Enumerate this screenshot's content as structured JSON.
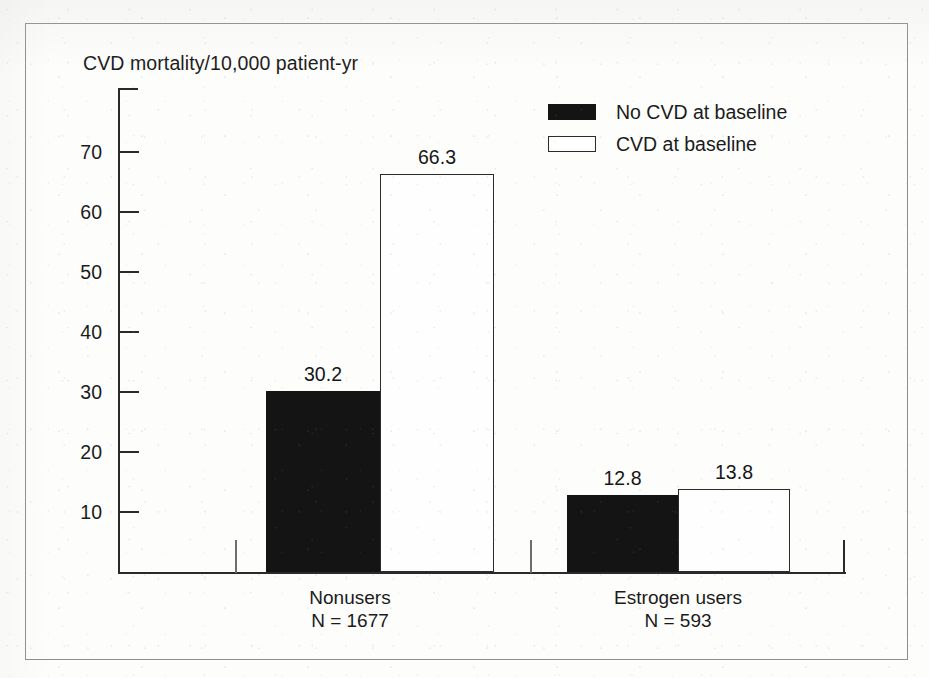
{
  "chart_data": {
    "type": "bar",
    "title": "",
    "ylabel": "CVD mortality/10,000 patient-yr",
    "xlabel": "",
    "ylim": [
      0,
      80
    ],
    "grid": false,
    "legend_position": "top-right",
    "categories": [
      "Nonusers",
      "Estrogen users"
    ],
    "category_sublabels": [
      "N = 1677",
      "N = 593"
    ],
    "yticks": [
      10,
      20,
      30,
      40,
      50,
      60,
      70
    ],
    "series": [
      {
        "name": "No CVD at baseline",
        "color": "#141414",
        "values": [
          30.2,
          12.8
        ],
        "labels": [
          "30.2",
          "12.8"
        ]
      },
      {
        "name": "CVD at baseline",
        "color": "#ffffff",
        "values": [
          66.3,
          13.8
        ],
        "labels": [
          "66.3",
          "13.8"
        ]
      }
    ]
  },
  "axis": {
    "title": "CVD mortality/10,000 patient-yr",
    "tick_labels": [
      "70",
      "60",
      "50",
      "40",
      "30",
      "20",
      "10"
    ]
  },
  "legend": {
    "items": [
      {
        "label": "No CVD at baseline",
        "swatch": "dark"
      },
      {
        "label": "CVD at baseline",
        "swatch": "light"
      }
    ]
  },
  "groups": [
    {
      "name": "Nonusers",
      "sublabel": "N = 1677",
      "bars": [
        {
          "series": "No CVD at baseline",
          "value": 30.2,
          "label": "30.2",
          "style": "dark"
        },
        {
          "series": "CVD at baseline",
          "value": 66.3,
          "label": "66.3",
          "style": "light"
        }
      ]
    },
    {
      "name": "Estrogen users",
      "sublabel": "N = 593",
      "bars": [
        {
          "series": "No CVD at baseline",
          "value": 12.8,
          "label": "12.8",
          "style": "dark"
        },
        {
          "series": "CVD at baseline",
          "value": 13.8,
          "label": "13.8",
          "style": "light"
        }
      ]
    }
  ],
  "colors": {
    "ink": "#141414",
    "axis": "#2a2a2a",
    "border": "#8d8d8d",
    "paper": "#fdfdfc"
  }
}
